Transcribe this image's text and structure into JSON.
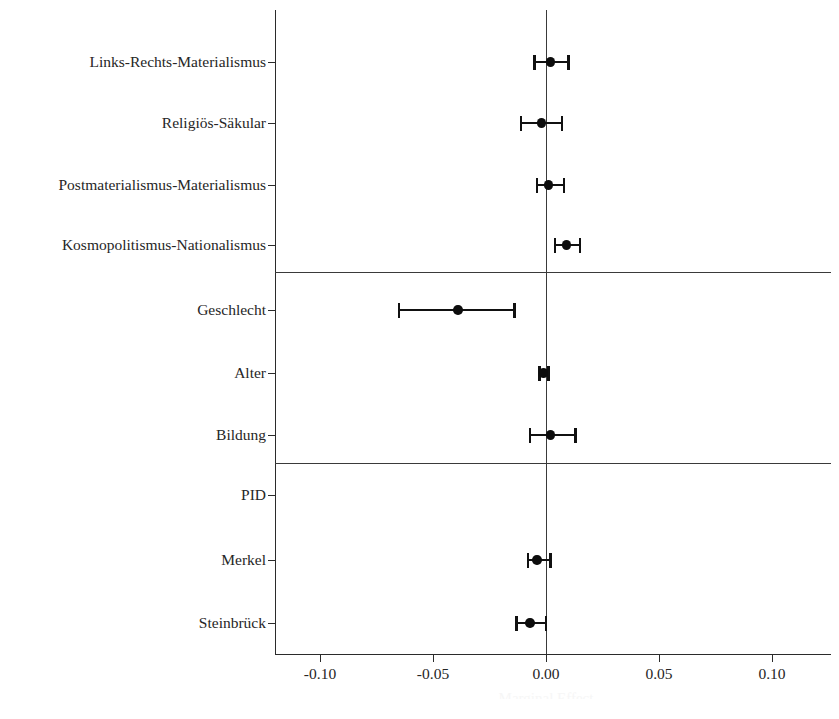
{
  "chart_data": {
    "type": "scatter",
    "subtype": "coefficient-plot",
    "title": "",
    "xlabel": "Marginal Effect",
    "ylabel": "",
    "xlim": [
      -0.125,
      0.125
    ],
    "grid": false,
    "legend": null,
    "zero_reference_line": 0.0,
    "xticks": [
      -0.1,
      -0.05,
      0.0,
      0.05,
      0.1
    ],
    "xtick_labels": [
      "-0.10",
      "-0.05",
      "0.00",
      "0.05",
      "0.10"
    ],
    "categories": [
      "Links-Rechts-Materialismus",
      "Religiös-Säkular",
      "Postmaterialismus-Materialismus",
      "Kosmopolitismus-Nationalismus",
      "Geschlecht",
      "Alter",
      "Bildung",
      "PID",
      "Merkel",
      "Steinbrück"
    ],
    "group_separators_after": [
      "Kosmopolitismus-Nationalismus",
      "Bildung"
    ],
    "points": [
      {
        "label": "Links-Rechts-Materialismus",
        "estimate": 0.002,
        "ci_low": -0.005,
        "ci_high": 0.01
      },
      {
        "label": "Religiös-Säkular",
        "estimate": -0.002,
        "ci_low": -0.011,
        "ci_high": 0.007
      },
      {
        "label": "Postmaterialismus-Materialismus",
        "estimate": 0.001,
        "ci_low": -0.004,
        "ci_high": 0.008
      },
      {
        "label": "Kosmopolitismus-Nationalismus",
        "estimate": 0.009,
        "ci_low": 0.004,
        "ci_high": 0.015
      },
      {
        "label": "Geschlecht",
        "estimate": -0.039,
        "ci_low": -0.065,
        "ci_high": -0.014
      },
      {
        "label": "Alter",
        "estimate": -0.001,
        "ci_low": -0.003,
        "ci_high": 0.001
      },
      {
        "label": "Bildung",
        "estimate": 0.002,
        "ci_low": -0.007,
        "ci_high": 0.013
      },
      {
        "label": "PID",
        "estimate": null,
        "ci_low": null,
        "ci_high": null
      },
      {
        "label": "Merkel",
        "estimate": -0.004,
        "ci_low": -0.008,
        "ci_high": 0.002
      },
      {
        "label": "Steinbrück",
        "estimate": -0.007,
        "ci_low": -0.013,
        "ci_high": 0.0
      }
    ]
  },
  "axis": {
    "x_title": "Marginal Effect",
    "tick_labels": [
      "-0.10",
      "-0.05",
      "0.00",
      "0.05",
      "0.10"
    ]
  },
  "labels": {
    "row_0": "Links-Rechts-Materialismus",
    "row_1": "Religiös-Säkular",
    "row_2": "Postmaterialismus-Materialismus",
    "row_3": "Kosmopolitismus-Nationalismus",
    "row_4": "Geschlecht",
    "row_5": "Alter",
    "row_6": "Bildung",
    "row_7": "PID",
    "row_8": "Merkel",
    "row_9": "Steinbrück"
  },
  "colors": {
    "point": "#0d0d0d",
    "interval": "#111111",
    "axis": "#2b2b2b",
    "background": "#ffffff"
  }
}
